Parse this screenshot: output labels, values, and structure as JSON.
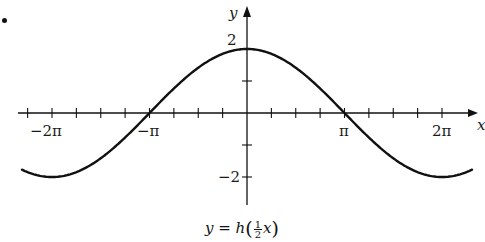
{
  "figure": {
    "bullet": "•",
    "caption": {
      "lhs": "y",
      "eq": " = ",
      "func": "h",
      "open": "(",
      "frac_num": "1",
      "frac_den": "2",
      "var": "x",
      "close": ")"
    }
  },
  "axes": {
    "x_label": "x",
    "y_label": "y",
    "x_tick_labels": [
      {
        "text": "−2π",
        "value": -6.2832,
        "left": 30,
        "top": 124
      },
      {
        "text": "−π",
        "value": -3.1416,
        "left": 137,
        "top": 124
      },
      {
        "text": "π",
        "value": 3.1416,
        "left": 339,
        "top": 124
      },
      {
        "text": "2π",
        "value": 6.2832,
        "left": 432,
        "top": 124
      }
    ],
    "y_tick_labels": [
      {
        "text": "2",
        "value": 2,
        "left": 227,
        "top": 33
      },
      {
        "text": "−2",
        "value": -2,
        "left": 218,
        "top": 170
      }
    ]
  },
  "chart_data": {
    "type": "line",
    "title": "",
    "caption": "y = h(½x)",
    "xlabel": "x",
    "ylabel": "y",
    "function": "y = 2cos(x/2)",
    "xlim": [
      -7.5,
      7.7
    ],
    "ylim": [
      -2.9,
      3.0
    ],
    "x_ticks_step": "π/4",
    "y_ticks": [
      -2,
      -1,
      1,
      2
    ],
    "x_tick_labels": [
      "−2π",
      "−π",
      "π",
      "2π"
    ],
    "y_tick_labels": [
      "2",
      "−2"
    ],
    "grid": false,
    "legend": null,
    "series": [
      {
        "name": "y = h(½x)",
        "x": [
          -7.25,
          -6.2832,
          -4.7124,
          -3.1416,
          -1.5708,
          0,
          1.5708,
          3.1416,
          4.7124,
          6.2832,
          7.25
        ],
        "y": [
          -1.7,
          -2.0,
          -1.414,
          0.0,
          1.414,
          2.0,
          1.414,
          0.0,
          -1.414,
          -2.0,
          -1.7
        ]
      }
    ],
    "key_points": {
      "max": {
        "x": 0,
        "y": 2
      },
      "min": [
        {
          "x": -6.2832,
          "y": -2
        },
        {
          "x": 6.2832,
          "y": -2
        }
      ],
      "zeros": [
        -3.1416,
        3.1416
      ]
    }
  },
  "style": {
    "stroke": "#111111",
    "background": "#ffffff"
  }
}
